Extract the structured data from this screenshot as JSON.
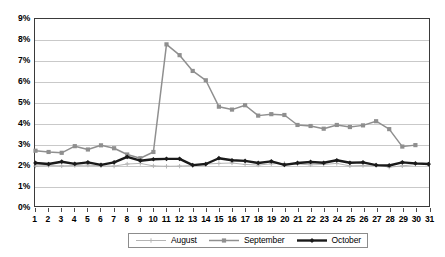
{
  "chart_data": {
    "type": "line",
    "title": "",
    "subtitle": "",
    "xlabel": "",
    "ylabel": "",
    "x": [
      1,
      2,
      3,
      4,
      5,
      6,
      7,
      8,
      9,
      10,
      11,
      12,
      13,
      14,
      15,
      16,
      17,
      18,
      19,
      20,
      21,
      22,
      23,
      24,
      25,
      26,
      27,
      28,
      29,
      30,
      31
    ],
    "x_tick_labels": [
      "1",
      "2",
      "3",
      "4",
      "5",
      "6",
      "7",
      "8",
      "9",
      "10",
      "11",
      "12",
      "13",
      "14",
      "15",
      "16",
      "17",
      "18",
      "19",
      "20",
      "21",
      "22",
      "23",
      "24",
      "25",
      "26",
      "27",
      "28",
      "29",
      "30",
      "31"
    ],
    "y_tick_labels": [
      "0%",
      "1%",
      "2%",
      "3%",
      "4%",
      "5%",
      "6%",
      "7%",
      "8%",
      "9%"
    ],
    "y_tick_values": [
      0,
      1,
      2,
      3,
      4,
      5,
      6,
      7,
      8,
      9
    ],
    "ylim": [
      0,
      9
    ],
    "xlim": [
      1,
      31
    ],
    "grid": "horizontal",
    "legend_position": "bottom-center",
    "value_unit": "%",
    "series": [
      {
        "name": "August",
        "color": "#b4b4b4",
        "marker": "cross",
        "line_width": 1,
        "values": [
          1.92,
          1.95,
          1.93,
          1.95,
          1.97,
          1.93,
          1.92,
          2.02,
          2.05,
          1.93,
          1.91,
          1.92,
          1.95,
          2.02,
          2.05,
          2.07,
          2.0,
          1.97,
          2.03,
          2.05,
          2.02,
          1.98,
          2.0,
          2.05,
          1.93,
          1.95,
          1.97,
          1.87,
          1.93,
          2.0,
          2.0
        ]
      },
      {
        "name": "September",
        "color": "#8f8f8f",
        "marker": "square",
        "line_width": 1.5,
        "values": [
          2.66,
          2.6,
          2.56,
          2.88,
          2.72,
          2.92,
          2.78,
          2.48,
          2.3,
          2.6,
          7.78,
          7.26,
          6.5,
          6.05,
          4.78,
          4.64,
          4.85,
          4.35,
          4.42,
          4.38,
          3.9,
          3.85,
          3.72,
          3.9,
          3.8,
          3.88,
          4.08,
          3.7,
          2.86,
          2.93,
          null
        ]
      },
      {
        "name": "October",
        "color": "#1a1a1a",
        "marker": "diamond",
        "line_width": 2.4,
        "values": [
          2.07,
          2.02,
          2.13,
          2.03,
          2.1,
          1.98,
          2.1,
          2.36,
          2.18,
          2.25,
          2.27,
          2.27,
          1.97,
          2.02,
          2.3,
          2.2,
          2.17,
          2.07,
          2.15,
          1.98,
          2.07,
          2.12,
          2.08,
          2.2,
          2.08,
          2.1,
          1.97,
          1.95,
          2.1,
          2.05,
          2.02
        ]
      }
    ]
  },
  "legend": {
    "items": [
      {
        "label": "August"
      },
      {
        "label": "September"
      },
      {
        "label": "October"
      }
    ]
  }
}
